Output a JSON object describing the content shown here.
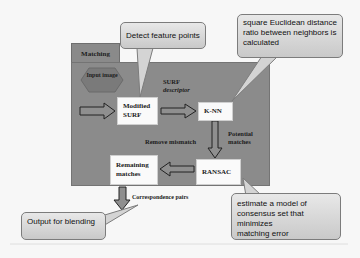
{
  "diagram": {
    "container_label": "Matching",
    "nodes": {
      "input_image": "Input image",
      "modified_surf": [
        "Modified",
        "SURF"
      ],
      "knn": "K-NN",
      "ransac": "RANSAC",
      "remaining_matches": [
        "Remaining",
        "matches"
      ]
    },
    "edge_labels": {
      "surf_descriptor": [
        "SURF",
        "descriptor"
      ],
      "potential_matches": [
        "Potential",
        "matches"
      ],
      "remove_mismatch": "Remove mismatch",
      "correspondence_pairs": "Correspondence pairs"
    },
    "callouts": {
      "detect": "Detect feature points",
      "knn_note": [
        "square Euclidean distance",
        "ratio between neighbors is",
        "calculated"
      ],
      "ransac_note": [
        "estimate a model of",
        "consensus set that minimizes",
        "matching error"
      ],
      "output": "Output for blending"
    },
    "colors": {
      "panel": "#8b8b8b",
      "box": "#fafafa",
      "callout_top": "#e8e8e8",
      "callout_bottom": "#c9c9c9",
      "hexagon": "#7a7a7a"
    }
  }
}
